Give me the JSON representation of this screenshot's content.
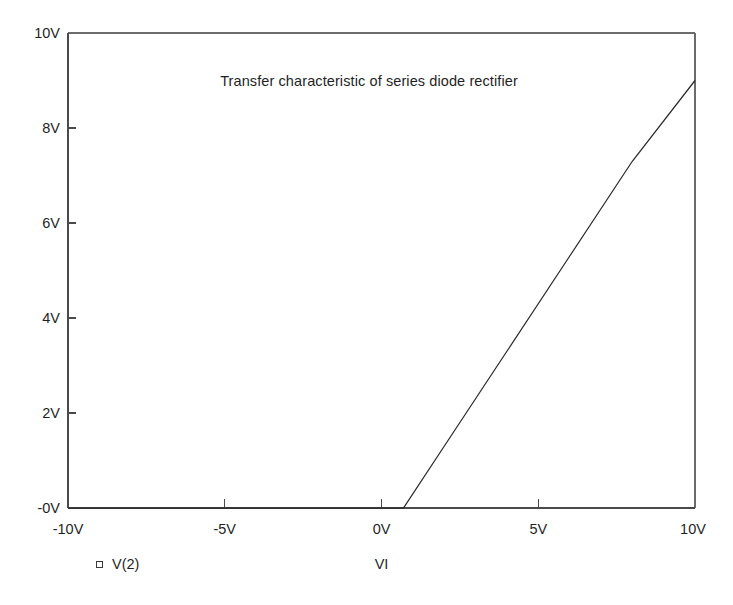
{
  "chart_data": {
    "type": "line",
    "title": "Transfer characteristic of series diode rectifier",
    "xlabel": "VI",
    "ylabel": "",
    "xlim": [
      -10,
      10
    ],
    "ylim": [
      0,
      10
    ],
    "grid": false,
    "legend_position": "below-axes-left",
    "xtick_labels": [
      "-10V",
      "-5V",
      "0V",
      "5V",
      "10V"
    ],
    "xtick_values": [
      -10,
      -5,
      0,
      5,
      10
    ],
    "ytick_labels": [
      "-0V",
      "2V",
      "4V",
      "6V",
      "8V",
      "10V"
    ],
    "ytick_values": [
      0,
      2,
      4,
      6,
      8,
      10
    ],
    "series": [
      {
        "name": "V(2)",
        "marker": "open-square",
        "color": "#2b2b2b",
        "x": [
          -10,
          -5,
          -2,
          0,
          0.7,
          2,
          4,
          6,
          8,
          10
        ],
        "values": [
          0,
          0,
          0,
          0,
          0,
          1.3,
          3.3,
          5.3,
          7.3,
          9.0
        ]
      }
    ],
    "annotations": {
      "knee_voltage": "0.7V",
      "description": "Output stays at 0V for inputs below the diode turn-on voltage, then rises linearly."
    }
  },
  "legend": {
    "entries": [
      {
        "marker_name": "open-square-marker",
        "label": "V(2)"
      }
    ]
  },
  "axes": {
    "x_axis_caption": "VI",
    "title": "Transfer characteristic of series diode rectifier"
  },
  "colors": {
    "background": "#ffffff",
    "frame": "#6b6b6b",
    "axis": "#4a4a4a",
    "curve": "#2b2b2b",
    "text": "#1f1f1f"
  }
}
